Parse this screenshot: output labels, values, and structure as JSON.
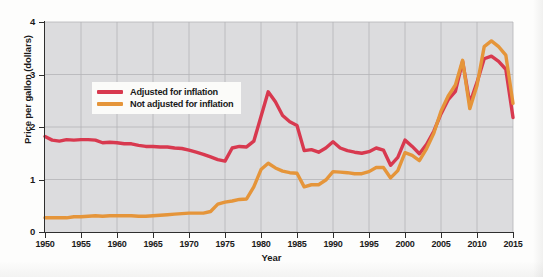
{
  "chart_data": {
    "type": "line",
    "title": "",
    "xlabel": "Year",
    "ylabel": "Price per gallon (dollars)",
    "xlim": [
      1950,
      2015
    ],
    "ylim": [
      0,
      4
    ],
    "grid": true,
    "legend_position": "upper-left-inside",
    "x_ticks": [
      "1950",
      "1955",
      "1960",
      "1965",
      "1970",
      "1975",
      "1980",
      "1985",
      "1990",
      "1995",
      "2000",
      "2005",
      "2010",
      "2015"
    ],
    "y_ticks": [
      "0",
      "1",
      "2",
      "3",
      "4"
    ],
    "colors": {
      "adjusted": "#d8394f",
      "not_adjusted": "#e5953a",
      "plot_background": "#dcdcde",
      "grid_line": "#b4b4b8",
      "axis": "#2e2e2e"
    },
    "x": [
      1950,
      1951,
      1952,
      1953,
      1954,
      1955,
      1956,
      1957,
      1958,
      1959,
      1960,
      1961,
      1962,
      1963,
      1964,
      1965,
      1966,
      1967,
      1968,
      1969,
      1970,
      1971,
      1972,
      1973,
      1974,
      1975,
      1976,
      1977,
      1978,
      1979,
      1980,
      1981,
      1982,
      1983,
      1984,
      1985,
      1986,
      1987,
      1988,
      1989,
      1990,
      1991,
      1992,
      1993,
      1994,
      1995,
      1996,
      1997,
      1998,
      1999,
      2000,
      2001,
      2002,
      2003,
      2004,
      2005,
      2006,
      2007,
      2008,
      2009,
      2010,
      2011,
      2012,
      2013,
      2014,
      2015
    ],
    "series": [
      {
        "name": "Adjusted for inflation",
        "color": "#d8394f",
        "values": [
          1.82,
          1.75,
          1.73,
          1.76,
          1.75,
          1.76,
          1.76,
          1.75,
          1.7,
          1.71,
          1.7,
          1.68,
          1.68,
          1.65,
          1.63,
          1.63,
          1.62,
          1.62,
          1.6,
          1.59,
          1.56,
          1.52,
          1.48,
          1.43,
          1.38,
          1.35,
          1.6,
          1.63,
          1.62,
          1.73,
          2.2,
          2.67,
          2.48,
          2.22,
          2.1,
          2.03,
          1.55,
          1.57,
          1.52,
          1.6,
          1.72,
          1.6,
          1.55,
          1.52,
          1.5,
          1.53,
          1.6,
          1.56,
          1.27,
          1.42,
          1.75,
          1.63,
          1.49,
          1.67,
          1.92,
          2.25,
          2.52,
          2.68,
          3.25,
          2.45,
          2.85,
          3.3,
          3.35,
          3.25,
          3.1,
          2.18
        ]
      },
      {
        "name": "Not adjusted for inflation",
        "color": "#e5953a",
        "values": [
          0.27,
          0.27,
          0.27,
          0.27,
          0.29,
          0.29,
          0.3,
          0.31,
          0.3,
          0.31,
          0.31,
          0.31,
          0.31,
          0.3,
          0.3,
          0.31,
          0.32,
          0.33,
          0.34,
          0.35,
          0.36,
          0.36,
          0.36,
          0.39,
          0.53,
          0.57,
          0.59,
          0.62,
          0.63,
          0.86,
          1.19,
          1.31,
          1.22,
          1.16,
          1.13,
          1.12,
          0.86,
          0.9,
          0.9,
          0.99,
          1.15,
          1.14,
          1.13,
          1.11,
          1.11,
          1.15,
          1.23,
          1.23,
          1.03,
          1.17,
          1.51,
          1.46,
          1.36,
          1.59,
          1.88,
          2.3,
          2.59,
          2.8,
          3.27,
          2.35,
          2.79,
          3.53,
          3.64,
          3.53,
          3.37,
          2.45
        ]
      }
    ]
  },
  "legend": {
    "items": [
      {
        "label": "Adjusted for inflation",
        "color": "#d8394f"
      },
      {
        "label": "Not adjusted for inflation",
        "color": "#e5953a"
      }
    ]
  }
}
